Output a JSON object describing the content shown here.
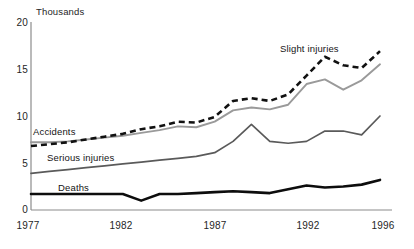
{
  "chart_data": {
    "type": "line",
    "title": "",
    "subtitle": "",
    "unit_label": "Thousands",
    "xlabel": "",
    "ylabel": "",
    "xlim": [
      1977,
      1996
    ],
    "ylim": [
      0,
      20
    ],
    "yticks": [
      "0",
      "5",
      "10",
      "15",
      "20"
    ],
    "ytick_values": [
      0,
      5,
      10,
      15,
      20
    ],
    "xticks": [
      "1977",
      "1982",
      "1987",
      "1992",
      "1996"
    ],
    "xtick_values": [
      1977,
      1982,
      1987,
      1992,
      1996
    ],
    "grid": false,
    "legend": "inline-labels",
    "x": [
      1977,
      1978,
      1979,
      1980,
      1981,
      1982,
      1983,
      1984,
      1985,
      1986,
      1987,
      1988,
      1989,
      1990,
      1991,
      1992,
      1993,
      1994,
      1995,
      1996
    ],
    "series": [
      {
        "name": "Slight injuries",
        "label": "Slight injuries",
        "style": "dashed",
        "color": "#111111",
        "values": [
          6.8,
          7.0,
          7.2,
          7.5,
          7.8,
          8.1,
          8.6,
          8.9,
          9.4,
          9.3,
          9.9,
          11.6,
          11.9,
          11.6,
          12.3,
          14.3,
          16.3,
          15.4,
          15.1,
          16.9
        ]
      },
      {
        "name": "Accidents",
        "label": "Accidents",
        "style": "solid",
        "color": "#9a9a9a",
        "values": [
          7.2,
          7.2,
          7.3,
          7.5,
          7.7,
          7.9,
          8.2,
          8.5,
          8.9,
          8.8,
          9.4,
          10.6,
          10.9,
          10.7,
          11.2,
          13.4,
          13.9,
          12.8,
          13.8,
          15.5
        ]
      },
      {
        "name": "Serious injuries",
        "label": "Serious injuries",
        "style": "solid",
        "color": "#5a5a5a",
        "values": [
          3.9,
          4.1,
          4.3,
          4.5,
          4.7,
          4.9,
          5.1,
          5.3,
          5.5,
          5.7,
          6.1,
          7.3,
          9.1,
          7.3,
          7.1,
          7.3,
          8.4,
          8.4,
          8.0,
          10.0
        ]
      },
      {
        "name": "Deaths",
        "label": "Deaths",
        "style": "solid-bold",
        "color": "#0d0d0d",
        "values": [
          1.7,
          1.7,
          1.7,
          1.7,
          1.7,
          1.7,
          1.0,
          1.7,
          1.7,
          1.8,
          1.9,
          2.0,
          1.9,
          1.8,
          2.2,
          2.6,
          2.4,
          2.5,
          2.7,
          3.2
        ]
      }
    ],
    "annotations": [
      {
        "text": "Slight injuries",
        "x": 1991.0,
        "y": 17.0
      },
      {
        "text": "Accidents",
        "x": 1977.3,
        "y": 8.4
      },
      {
        "text": "Serious injuries",
        "x": 1978.2,
        "y": 5.6
      },
      {
        "text": "Deaths",
        "x": 1980.6,
        "y": 2.8
      }
    ]
  },
  "axis": {
    "unit_label": "Thousands",
    "y_labels": [
      "20",
      "15",
      "10",
      "5",
      "0"
    ],
    "x_labels": [
      "1977",
      "1982",
      "1987",
      "1992",
      "1996"
    ]
  },
  "colors": {
    "axis": "#8c8c8c",
    "slight_injuries": "#111111",
    "accidents": "#9a9a9a",
    "serious_injuries": "#5a5a5a",
    "deaths": "#0d0d0d",
    "background": "#ffffff",
    "text": "#262626"
  }
}
